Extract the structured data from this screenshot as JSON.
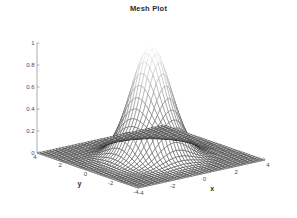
{
  "figure": {
    "title": "Mesh Plot",
    "background_color": "#ffffff",
    "axis_color": "#8a8a8a",
    "text_color": "#2b2b2b"
  },
  "chart_data": {
    "type": "surface",
    "render": "mesh",
    "title": "Mesh Plot",
    "xlabel": "x",
    "ylabel": "y",
    "zlabel": "",
    "xlim": [
      -4,
      4
    ],
    "ylim": [
      -4,
      4
    ],
    "zlim": [
      0,
      1
    ],
    "xticks": [
      -4,
      -2,
      0,
      2,
      4
    ],
    "yticks": [
      -4,
      -2,
      0,
      2,
      4
    ],
    "zticks": [
      0,
      0.2,
      0.4,
      0.6,
      0.8,
      1
    ],
    "xticklabels": [
      "-4",
      "-2",
      "0",
      "2",
      "4"
    ],
    "yticklabels": [
      "-4",
      "-2",
      "0",
      "2",
      "4"
    ],
    "zticklabels": [
      "0",
      "0.2",
      "0.4",
      "0.6",
      "0.8",
      "1"
    ],
    "grid": false,
    "legend": null,
    "colormap": "gray",
    "colormap_low": "#1a1a1a",
    "colormap_high": "#ffffff",
    "function": "z = exp(-(x^2 + y^2)/2)",
    "peak": {
      "x": 0,
      "y": 0,
      "z": 1
    },
    "grid_n": 41,
    "view": {
      "azimuth": -37.5,
      "elevation": 30
    }
  }
}
